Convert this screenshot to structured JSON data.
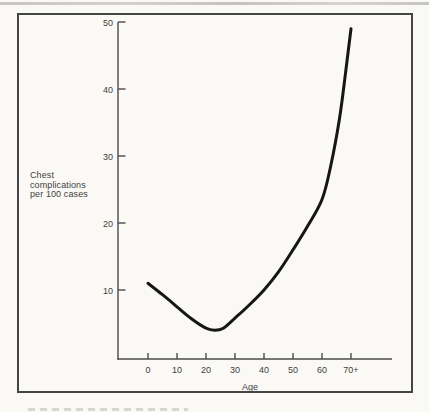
{
  "figure": {
    "background": "#faf9f6",
    "border_color": "#454545",
    "axis_color": "#4b4b4b",
    "text_color": "#3e3e3e",
    "curve_color": "#161616"
  },
  "chart_data": {
    "type": "line",
    "title": "",
    "xlabel": "Age",
    "ylabel": "Chest complications per 100 cases",
    "ylabel_lines": [
      "Chest",
      "complications",
      "per 100 cases"
    ],
    "x_tick_labels": [
      "0",
      "10",
      "20",
      "30",
      "40",
      "50",
      "60",
      "70+"
    ],
    "x_tick_values": [
      0,
      10,
      20,
      30,
      40,
      50,
      60,
      70
    ],
    "y_tick_labels": [
      "10",
      "20",
      "30",
      "40",
      "50"
    ],
    "y_tick_values": [
      10,
      20,
      30,
      40,
      50
    ],
    "xlim": [
      0,
      84
    ],
    "ylim": [
      0,
      50
    ],
    "grid": false,
    "legend": "none",
    "series": [
      {
        "name": "Chest complications per 100 cases",
        "color": "#161616",
        "points": [
          [
            0,
            11
          ],
          [
            5,
            9.3
          ],
          [
            10,
            7.5
          ],
          [
            15,
            5.7
          ],
          [
            20,
            4.3
          ],
          [
            23,
            4.0
          ],
          [
            26,
            4.3
          ],
          [
            30,
            5.8
          ],
          [
            35,
            7.8
          ],
          [
            40,
            10
          ],
          [
            45,
            12.7
          ],
          [
            50,
            16
          ],
          [
            55,
            19.5
          ],
          [
            60,
            23.5
          ],
          [
            63,
            28.5
          ],
          [
            66,
            35.5
          ],
          [
            68,
            42
          ],
          [
            70,
            49
          ]
        ]
      }
    ]
  }
}
